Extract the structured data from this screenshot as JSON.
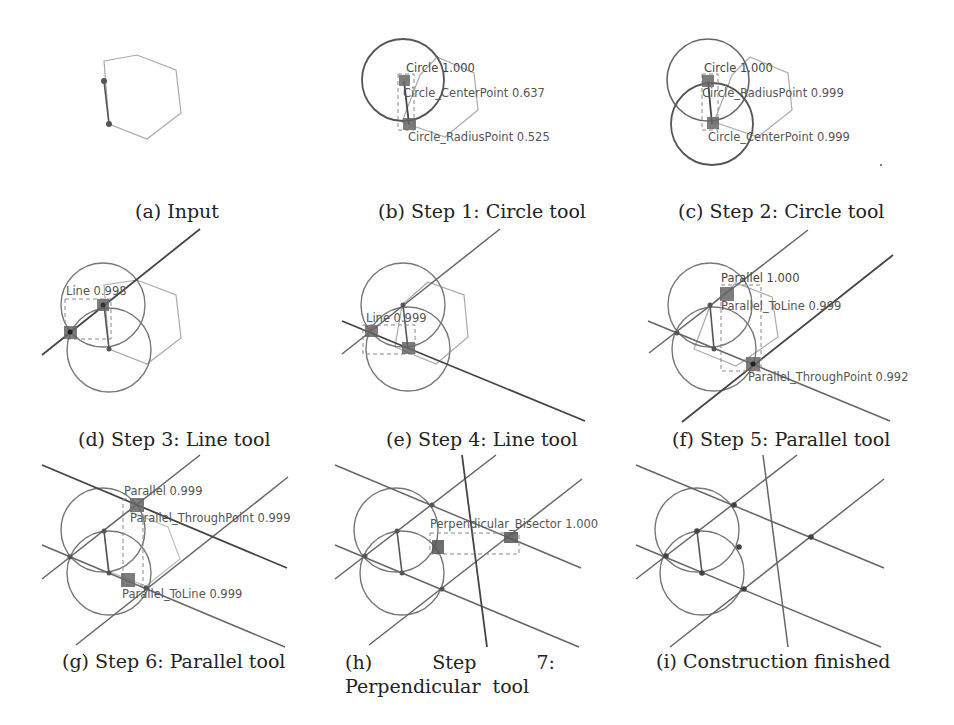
{
  "figure": {
    "panels": [
      {
        "id": "a",
        "caption": "(a) Input",
        "labels": []
      },
      {
        "id": "b",
        "caption": "(b) Step 1: Circle tool",
        "labels": [
          {
            "text": "Circle 1.000"
          },
          {
            "text": "Circle_CenterPoint 0.637"
          },
          {
            "text": "Circle_RadiusPoint 0.525"
          }
        ]
      },
      {
        "id": "c",
        "caption": "(c) Step 2: Circle tool",
        "labels": [
          {
            "text": "Circle 1.000"
          },
          {
            "text": "Circle_RadiusPoint 0.999"
          },
          {
            "text": "Circle_CenterPoint 0.999"
          }
        ]
      },
      {
        "id": "d",
        "caption": "(d) Step 3: Line tool",
        "labels": [
          {
            "text": "Line 0.998"
          }
        ]
      },
      {
        "id": "e",
        "caption": "(e) Step 4: Line tool",
        "labels": [
          {
            "text": "Line 0.999"
          }
        ]
      },
      {
        "id": "f",
        "caption": "(f) Step 5: Parallel tool",
        "labels": [
          {
            "text": "Parallel 1.000"
          },
          {
            "text": "Parallel_ToLine 0.999"
          },
          {
            "text": "Parallel_ThroughPoint 0.992"
          }
        ]
      },
      {
        "id": "g",
        "caption": "(g) Step 6: Parallel tool",
        "labels": [
          {
            "text": "Parallel 0.999"
          },
          {
            "text": "Parallel_ThroughPoint 0.999"
          },
          {
            "text": "Parallel_ToLine 0.999"
          }
        ]
      },
      {
        "id": "h",
        "caption": "(h) Step 7: Perpendicular tool",
        "labels": [
          {
            "text": "Perpendicular_Bisector 1.000"
          }
        ]
      },
      {
        "id": "i",
        "caption": "(i) Construction finished",
        "labels": []
      }
    ],
    "colors": {
      "hexagon": "#aaaaaa",
      "construction": "#777777",
      "active": "#444444",
      "point": "#555555",
      "bbox": "#888888"
    }
  }
}
